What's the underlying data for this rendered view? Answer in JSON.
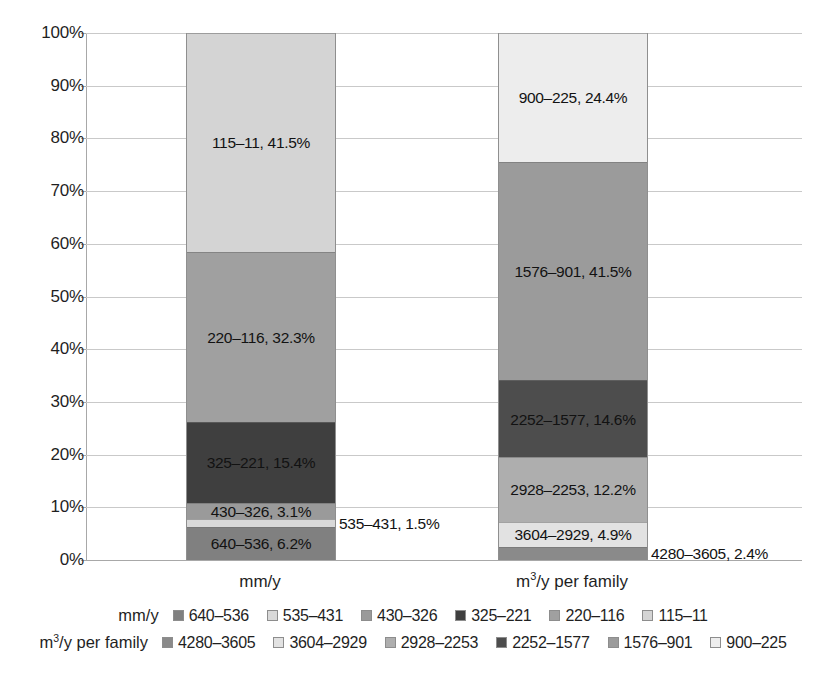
{
  "chart_data": {
    "type": "bar",
    "subtype": "100% stacked column",
    "title": "",
    "xlabel": "",
    "ylabel": "",
    "ylim": [
      0,
      100
    ],
    "yticks": [
      "0%",
      "10%",
      "20%",
      "30%",
      "40%",
      "50%",
      "60%",
      "70%",
      "80%",
      "90%",
      "100%"
    ],
    "grid": true,
    "legend_position": "bottom",
    "categories": [
      "mm/y",
      "m3/y per family"
    ],
    "category_labels": [
      {
        "text": "mm/y",
        "base": "mm/y",
        "sup": ""
      },
      {
        "text": "m3/y per family",
        "base": "m",
        "sup": "3",
        "tail": "/y per family"
      }
    ],
    "series": [
      {
        "name": "mm/y",
        "category": "mm/y",
        "segments": [
          {
            "name": "640-536",
            "value": 6.2,
            "label": "640–536, 6.2%",
            "color": "#808080",
            "outside": false
          },
          {
            "name": "535-431",
            "value": 1.5,
            "label": "535–431, 1.5%",
            "color": "#d9d9d9",
            "outside": true
          },
          {
            "name": "430-326",
            "value": 3.1,
            "label": "430–326, 3.1%",
            "color": "#9a9a9a",
            "outside": false
          },
          {
            "name": "325-221",
            "value": 15.4,
            "label": "325–221, 15.4%",
            "color": "#3f3f3f",
            "outside": false
          },
          {
            "name": "220-116",
            "value": 32.3,
            "label": "220–116, 32.3%",
            "color": "#a0a0a0",
            "outside": false
          },
          {
            "name": "115-11",
            "value": 41.5,
            "label": "115–11, 41.5%",
            "color": "#d4d4d4",
            "outside": false
          }
        ]
      },
      {
        "name": "m3/y per family",
        "category": "m3/y per family",
        "segments": [
          {
            "name": "4280-3605",
            "value": 2.4,
            "label": "4280–3605, 2.4%",
            "color": "#8a8a8a",
            "outside": true
          },
          {
            "name": "3604-2929",
            "value": 4.9,
            "label": "3604–2929, 4.9%",
            "color": "#e2e2e2",
            "outside": false
          },
          {
            "name": "2928-2253",
            "value": 12.2,
            "label": "2928–2253, 12.2%",
            "color": "#aeaeae",
            "outside": false
          },
          {
            "name": "2252-1577",
            "value": 14.6,
            "label": "2252–1577, 14.6%",
            "color": "#4d4d4d",
            "outside": false
          },
          {
            "name": "1576-901",
            "value": 41.5,
            "label": "1576–901, 41.5%",
            "color": "#9b9b9b",
            "outside": false
          },
          {
            "name": "900-225",
            "value": 24.4,
            "label": "900–225, 24.4%",
            "color": "#ededed",
            "outside": false
          }
        ]
      }
    ]
  },
  "legend": {
    "rows": [
      {
        "title": "mm/y",
        "title_base": "mm/y",
        "title_sup": "",
        "title_tail": "",
        "items": [
          {
            "label": "640–536",
            "color": "#808080"
          },
          {
            "label": "535–431",
            "color": "#d9d9d9"
          },
          {
            "label": "430–326",
            "color": "#9a9a9a"
          },
          {
            "label": "325–221",
            "color": "#3f3f3f"
          },
          {
            "label": "220–116",
            "color": "#a0a0a0"
          },
          {
            "label": "115–11",
            "color": "#d4d4d4"
          }
        ]
      },
      {
        "title": "m3/y per family",
        "title_base": "m",
        "title_sup": "3",
        "title_tail": "/y per family",
        "items": [
          {
            "label": "4280–3605",
            "color": "#8a8a8a"
          },
          {
            "label": "3604–2929",
            "color": "#e2e2e2"
          },
          {
            "label": "2928–2253",
            "color": "#aeaeae"
          },
          {
            "label": "2252–1577",
            "color": "#4d4d4d"
          },
          {
            "label": "1576–901",
            "color": "#9b9b9b"
          },
          {
            "label": "900–225",
            "color": "#ededed"
          }
        ]
      }
    ]
  },
  "axis": {
    "y_ticks": [
      "100%",
      "90%",
      "80%",
      "70%",
      "60%",
      "50%",
      "40%",
      "30%",
      "20%",
      "10%",
      "0%"
    ]
  }
}
